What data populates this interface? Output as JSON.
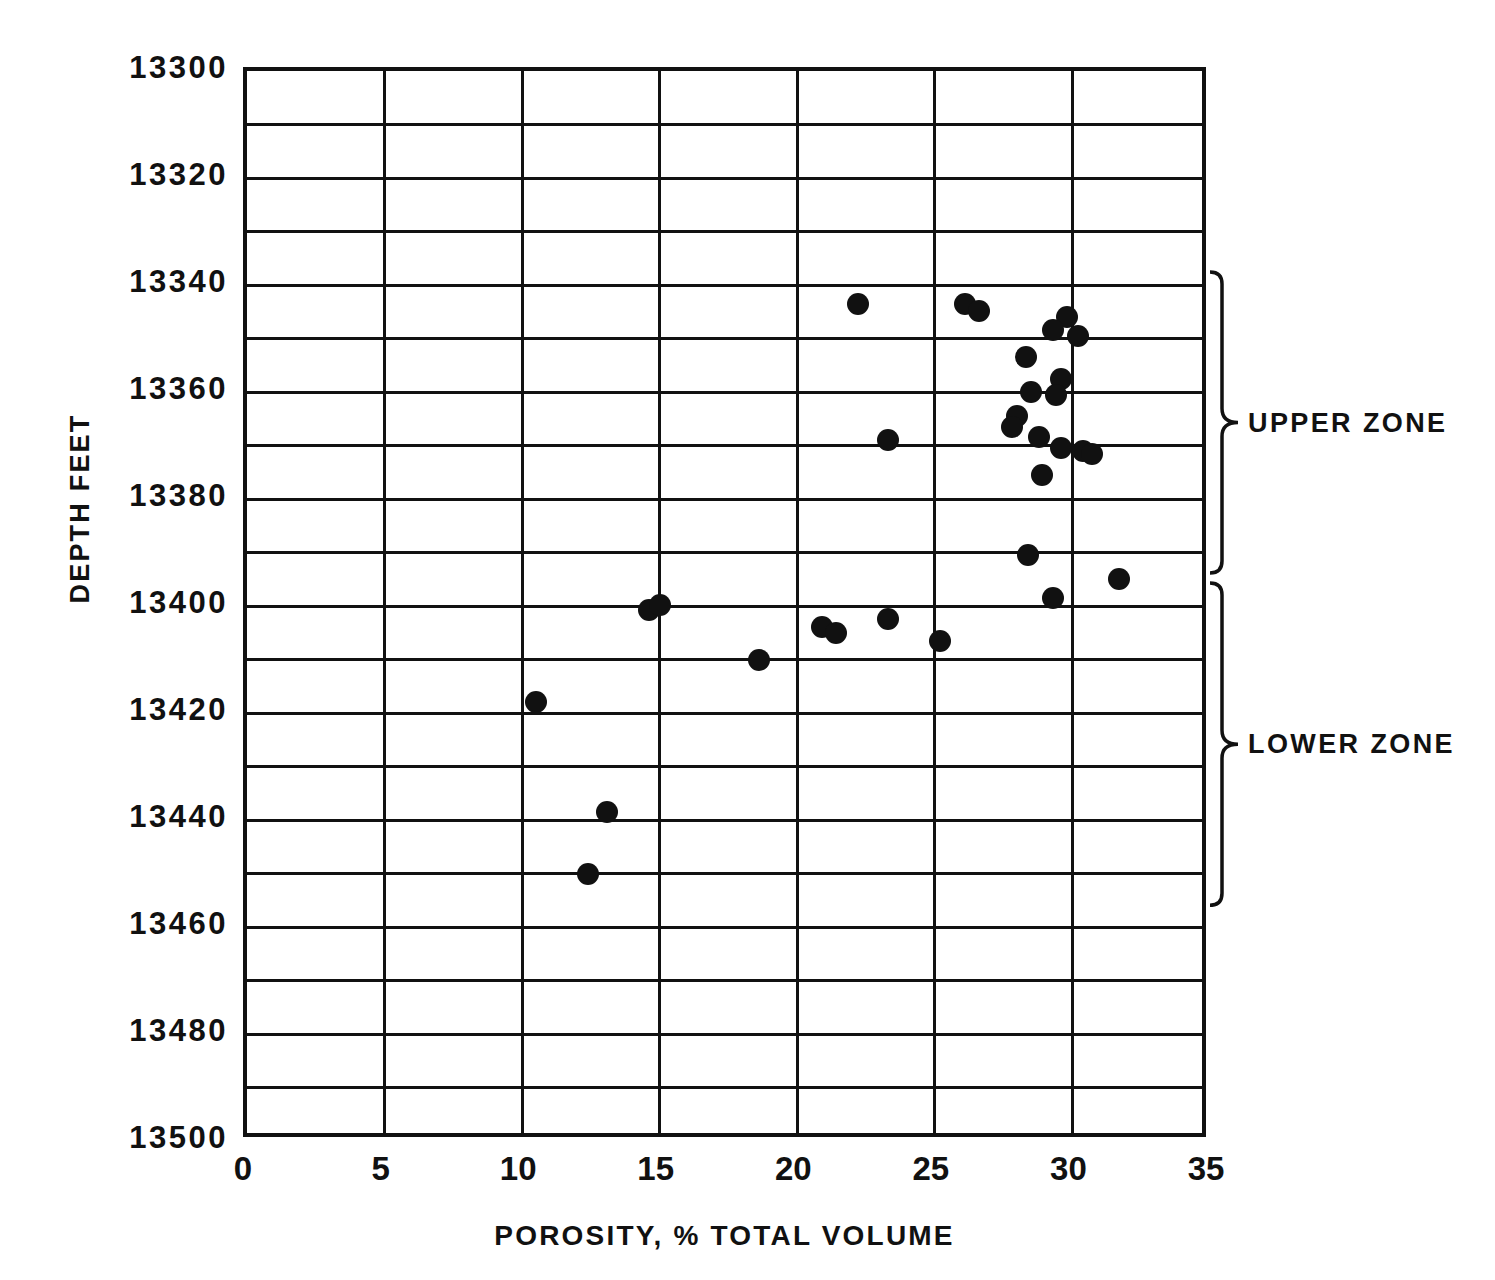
{
  "chart_data": {
    "type": "scatter",
    "title": "",
    "xlabel": "POROSITY, % TOTAL VOLUME",
    "ylabel": "DEPTH FEET",
    "xlim": [
      0,
      35
    ],
    "ylim": [
      13500,
      13300
    ],
    "y_inverted": true,
    "grid": true,
    "x_ticks": [
      0,
      5,
      10,
      15,
      20,
      25,
      30,
      35
    ],
    "x_tick_labels": [
      "0",
      "5",
      "10",
      "15",
      "20",
      "25",
      "30",
      "35"
    ],
    "y_ticks": [
      13300,
      13320,
      13340,
      13360,
      13380,
      13400,
      13420,
      13440,
      13460,
      13480,
      13500
    ],
    "y_tick_labels": [
      "13300",
      "13320",
      "13340",
      "13360",
      "13380",
      "13400",
      "13420",
      "13440",
      "13460",
      "13480",
      "13500"
    ],
    "y_minor_gridline_interval": 10,
    "x_gridline_interval": 5,
    "marker": "filled-circle",
    "marker_color": "#111111",
    "points": [
      {
        "x": 22.2,
        "y": 13343.5
      },
      {
        "x": 26.1,
        "y": 13343.5
      },
      {
        "x": 26.6,
        "y": 13344.8
      },
      {
        "x": 29.8,
        "y": 13346.0
      },
      {
        "x": 29.3,
        "y": 13348.5
      },
      {
        "x": 30.2,
        "y": 13349.5
      },
      {
        "x": 28.3,
        "y": 13353.5
      },
      {
        "x": 29.6,
        "y": 13357.5
      },
      {
        "x": 29.4,
        "y": 13360.5
      },
      {
        "x": 28.5,
        "y": 13360.0
      },
      {
        "x": 28.0,
        "y": 13364.5
      },
      {
        "x": 27.8,
        "y": 13366.5
      },
      {
        "x": 23.3,
        "y": 13369.0
      },
      {
        "x": 28.8,
        "y": 13368.5
      },
      {
        "x": 29.6,
        "y": 13370.5
      },
      {
        "x": 30.4,
        "y": 13371.0
      },
      {
        "x": 30.7,
        "y": 13371.5
      },
      {
        "x": 28.9,
        "y": 13375.5
      },
      {
        "x": 28.4,
        "y": 13390.5
      },
      {
        "x": 31.7,
        "y": 13395.0
      },
      {
        "x": 29.3,
        "y": 13398.5
      },
      {
        "x": 14.6,
        "y": 13400.8
      },
      {
        "x": 15.0,
        "y": 13399.8
      },
      {
        "x": 23.3,
        "y": 13402.5
      },
      {
        "x": 20.9,
        "y": 13404.0
      },
      {
        "x": 21.4,
        "y": 13405.0
      },
      {
        "x": 25.2,
        "y": 13406.5
      },
      {
        "x": 18.6,
        "y": 13410.0
      },
      {
        "x": 10.5,
        "y": 13418.0
      },
      {
        "x": 13.1,
        "y": 13438.5
      },
      {
        "x": 12.4,
        "y": 13450.0
      }
    ],
    "annotations": [
      {
        "label": "UPPER ZONE",
        "y_start": 13338,
        "y_end": 13395
      },
      {
        "label": "LOWER ZONE",
        "y_start": 13396,
        "y_end": 13457
      }
    ]
  }
}
